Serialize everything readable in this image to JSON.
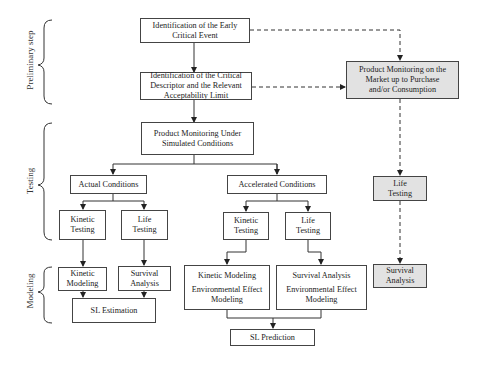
{
  "phases": {
    "preliminary": "Preliminary step",
    "testing": "Testing",
    "modeling": "Modeling"
  },
  "boxes": {
    "early_event": [
      "Identification of the Early",
      "Critical Event"
    ],
    "critical_descriptor": [
      "Identification of the Critical",
      "Descriptor and the Relevant",
      "Acceptability Limit"
    ],
    "monitoring_simulated": [
      "Product Monitoring Under",
      "Simulated Conditions"
    ],
    "monitoring_market": [
      "Product Monitoring on the",
      "Market up to Purchase",
      "and/or Consumption"
    ],
    "actual_conditions": "Actual Conditions",
    "accelerated_conditions": "Accelerated Conditions",
    "actual_kinetic_testing": [
      "Kinetic",
      "Testing"
    ],
    "actual_life_testing": [
      "Life",
      "Testing"
    ],
    "accel_kinetic_testing": [
      "Kinetic",
      "Testing"
    ],
    "accel_life_testing": [
      "Life",
      "Testing"
    ],
    "market_life_testing": [
      "Life",
      "Testing"
    ],
    "actual_kinetic_modeling": [
      "Kinetic",
      "Modeling"
    ],
    "actual_survival_analysis": [
      "Survival",
      "Analysis"
    ],
    "sl_estimation": "SL Estimation",
    "accel_kinetic_modeling": [
      "Kinetic Modeling",
      "Environmental Effect",
      "Modeling"
    ],
    "accel_survival_analysis": [
      "Survival Analysis",
      "Environmental Effect",
      "Modeling"
    ],
    "market_survival_analysis": [
      "Survival",
      "Analysis"
    ],
    "sl_prediction": "SL Prediction"
  },
  "colors": {
    "line": "#333333",
    "shaded_fill": "#e2e2e2"
  }
}
